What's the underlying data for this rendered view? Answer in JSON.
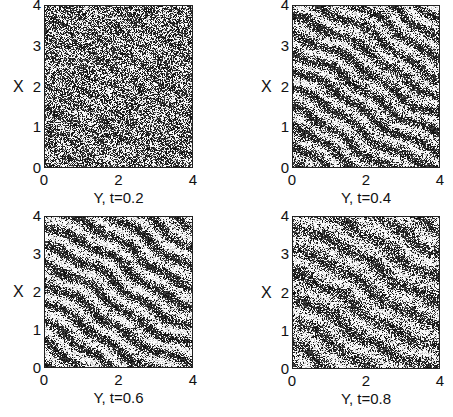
{
  "chart_data": [
    {
      "type": "heatmap",
      "subtype": "scatter-density",
      "title": "",
      "xlabel": "Y, t=0.2",
      "ylabel": "X",
      "xlim": [
        0,
        4
      ],
      "ylim": [
        0,
        4
      ],
      "xticks": [
        "0",
        "2",
        "4"
      ],
      "yticks": [
        "0",
        "1",
        "2",
        "3",
        "4"
      ],
      "t": 0.2,
      "pattern": {
        "density": 0.55,
        "stripe_strength": 0.12,
        "stripe_angle_deg": -30,
        "stripe_period_px": 17
      }
    },
    {
      "type": "heatmap",
      "subtype": "scatter-density",
      "title": "",
      "xlabel": "Y, t=0.4",
      "ylabel": "X",
      "xlim": [
        0,
        4
      ],
      "ylim": [
        0,
        4
      ],
      "xticks": [
        "0",
        "2",
        "4"
      ],
      "yticks": [
        "0",
        "1",
        "2",
        "3",
        "4"
      ],
      "t": 0.4,
      "pattern": {
        "density": 0.5,
        "stripe_strength": 0.38,
        "stripe_angle_deg": -30,
        "stripe_period_px": 17
      }
    },
    {
      "type": "heatmap",
      "subtype": "scatter-density",
      "title": "",
      "xlabel": "Y, t=0.6",
      "ylabel": "X",
      "xlim": [
        0,
        4
      ],
      "ylim": [
        0,
        4
      ],
      "xticks": [
        "0",
        "2",
        "4"
      ],
      "yticks": [
        "0",
        "1",
        "2",
        "3",
        "4"
      ],
      "t": 0.6,
      "pattern": {
        "density": 0.48,
        "stripe_strength": 0.42,
        "stripe_angle_deg": -30,
        "stripe_period_px": 18
      }
    },
    {
      "type": "heatmap",
      "subtype": "scatter-density",
      "title": "",
      "xlabel": "Y, t=0.8",
      "ylabel": "X",
      "xlim": [
        0,
        4
      ],
      "ylim": [
        0,
        4
      ],
      "xticks": [
        "0",
        "2",
        "4"
      ],
      "yticks": [
        "0",
        "1",
        "2",
        "3",
        "4"
      ],
      "t": 0.8,
      "pattern": {
        "density": 0.48,
        "stripe_strength": 0.32,
        "stripe_angle_deg": -28,
        "stripe_period_px": 22
      }
    }
  ],
  "colors": {
    "ink": "#111111",
    "background": "#ffffff",
    "frame": "#222222"
  }
}
